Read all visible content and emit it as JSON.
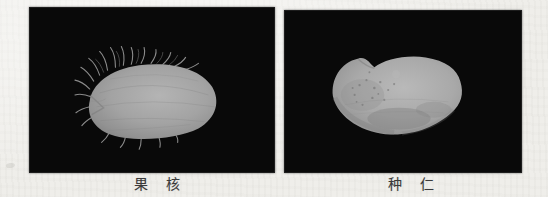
{
  "figure": {
    "background_color": "#efeeea",
    "panel_color": "#090909",
    "specimen_color": "#a6a6a6",
    "caption_color": "#3a3a3a",
    "panels": [
      {
        "image": "hairy-fruit-stone-photo",
        "caption": "果　核"
      },
      {
        "image": "seed-kernel-photo",
        "caption": "种　仁"
      }
    ]
  }
}
